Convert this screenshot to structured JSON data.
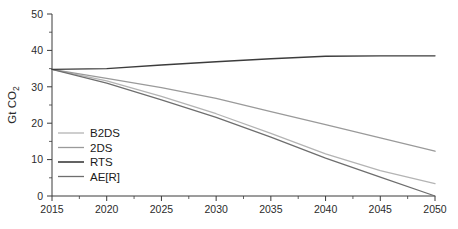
{
  "chart_data": {
    "type": "line",
    "title": "",
    "xlabel": "",
    "ylabel": "Gt CO2",
    "ylabel_display": "Gt CO",
    "ylabel_sub": "2",
    "xlim": [
      2015,
      2050
    ],
    "ylim": [
      0,
      50
    ],
    "grid": false,
    "legend_position": "lower-left-inside",
    "x_ticks": [
      2015,
      2020,
      2025,
      2030,
      2035,
      2040,
      2045,
      2050
    ],
    "x_tick_labels": [
      "2015",
      "2020",
      "2025",
      "2030",
      "2035",
      "2040",
      "2045",
      "2050"
    ],
    "x_minor_ticks": [
      2017.5,
      2022.5,
      2027.5,
      2032.5,
      2037.5,
      2042.5,
      2047.5
    ],
    "y_ticks": [
      0,
      10,
      20,
      30,
      40,
      50
    ],
    "y_tick_labels": [
      "0",
      "10",
      "20",
      "30",
      "40",
      "50"
    ],
    "y_minor_ticks": [
      5,
      15,
      25,
      35,
      45
    ],
    "x": [
      2015,
      2020,
      2025,
      2030,
      2035,
      2040,
      2045,
      2050
    ],
    "series": [
      {
        "name": "B2DS",
        "color": "#b4b4b4",
        "width": 1.3,
        "values": [
          34.8,
          31.6,
          27.4,
          22.6,
          17.2,
          11.6,
          7.0,
          3.4
        ]
      },
      {
        "name": "2DS",
        "color": "#9a9a9a",
        "width": 1.3,
        "values": [
          34.8,
          32.3,
          29.8,
          26.8,
          23.2,
          19.6,
          16.0,
          12.3
        ]
      },
      {
        "name": "RTS",
        "color": "#3c3c3c",
        "width": 1.4,
        "values": [
          34.8,
          35.0,
          36.0,
          36.9,
          37.7,
          38.4,
          38.5,
          38.5
        ]
      },
      {
        "name": "AE[R]",
        "color": "#6e6e6e",
        "width": 1.3,
        "values": [
          34.8,
          31.0,
          26.4,
          21.6,
          16.2,
          10.4,
          5.2,
          0.0
        ]
      }
    ]
  },
  "legend": {
    "entries": [
      {
        "label": "B2DS",
        "color": "#b4b4b4"
      },
      {
        "label": "2DS",
        "color": "#9a9a9a"
      },
      {
        "label": "RTS",
        "color": "#3c3c3c"
      },
      {
        "label": "AE[R]",
        "color": "#6e6e6e"
      }
    ]
  }
}
